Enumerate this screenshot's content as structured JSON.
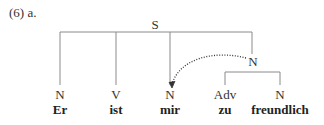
{
  "example": {
    "label": "(6) a."
  },
  "tree": {
    "root": "S",
    "phrase_node": "N",
    "leaves": [
      {
        "category": "N",
        "word": "Er"
      },
      {
        "category": "V",
        "word": "ist"
      },
      {
        "category": "N",
        "word": "mir"
      },
      {
        "category": "Adv",
        "word": "zu"
      },
      {
        "category": "N",
        "word": "freundlich"
      }
    ],
    "arrow": {
      "from": "N (phrase)",
      "to": "N (mir)",
      "style": "dotted"
    }
  },
  "colors": {
    "line": "#8a8a8a",
    "text": "#2a2a2a"
  }
}
